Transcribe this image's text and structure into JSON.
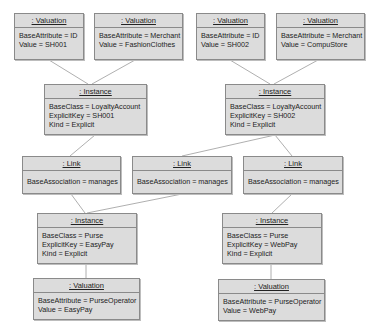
{
  "diagram": {
    "type": "UML object diagram",
    "nodes": [
      {
        "id": "val1",
        "title": ": Valuation",
        "attrs": [
          "BaseAttribute = ID",
          "Value = SH001"
        ]
      },
      {
        "id": "val2",
        "title": ": Valuation",
        "attrs": [
          "BaseAttribute = Merchant",
          "Value = FashionClothes"
        ]
      },
      {
        "id": "val3",
        "title": ": Valuation",
        "attrs": [
          "BaseAttribute = ID",
          "Value = SH002"
        ]
      },
      {
        "id": "val4",
        "title": ": Valuation",
        "attrs": [
          "BaseAttribute = Merchant",
          "Value = CompuStore"
        ]
      },
      {
        "id": "inst1",
        "title": ": Instance",
        "attrs": [
          "BaseClass = LoyaltyAccount",
          "ExplicitKey = SH001",
          "Kind = Explicit"
        ]
      },
      {
        "id": "inst2",
        "title": ": Instance",
        "attrs": [
          "BaseClass = LoyaltyAccount",
          "ExplicitKey = SH002",
          "Kind = Explicit"
        ]
      },
      {
        "id": "link1",
        "title": ": Link",
        "attrs": [
          "BaseAssociation = manages"
        ]
      },
      {
        "id": "link2",
        "title": ": Link",
        "attrs": [
          "BaseAssociation = manages"
        ]
      },
      {
        "id": "link3",
        "title": ": Link",
        "attrs": [
          "BaseAssociation = manages"
        ]
      },
      {
        "id": "inst3",
        "title": ": Instance",
        "attrs": [
          "BaseClass = Purse",
          "ExplicitKey = EasyPay",
          "Kind = Explicit"
        ]
      },
      {
        "id": "inst4",
        "title": ": Instance",
        "attrs": [
          "BaseClass = Purse",
          "ExplicitKey = WebPay",
          "Kind = Explicit"
        ]
      },
      {
        "id": "val5",
        "title": ": Valuation",
        "attrs": [
          "BaseAttribute = PurseOperator",
          "Value = EasyPay"
        ]
      },
      {
        "id": "val6",
        "title": ": Valuation",
        "attrs": [
          "BaseAttribute = PurseOperator",
          "Value = WebPay"
        ]
      }
    ],
    "edges": [
      [
        "val1",
        "inst1"
      ],
      [
        "val2",
        "inst1"
      ],
      [
        "val3",
        "inst2"
      ],
      [
        "val4",
        "inst2"
      ],
      [
        "inst1",
        "link1"
      ],
      [
        "inst2",
        "link2"
      ],
      [
        "inst2",
        "link3"
      ],
      [
        "link1",
        "inst3"
      ],
      [
        "link2",
        "inst3"
      ],
      [
        "link3",
        "inst4"
      ],
      [
        "inst3",
        "val5"
      ],
      [
        "inst4",
        "val6"
      ]
    ],
    "colors": {
      "box_fill": "#dcdcdc",
      "box_border": "#8a8a8a",
      "edge": "#9a9a9a",
      "text": "#222222"
    }
  }
}
